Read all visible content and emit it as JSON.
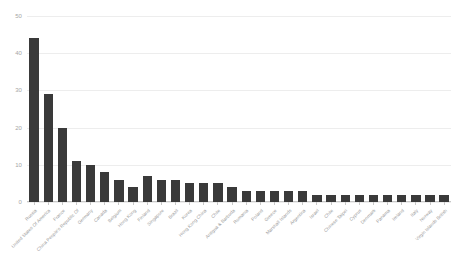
{
  "chart_data": {
    "type": "bar",
    "title": "",
    "subtitle": "",
    "xlabel": "",
    "ylabel": "",
    "ylim": [
      0,
      50
    ],
    "yticks": [
      0,
      10,
      20,
      30,
      40,
      50
    ],
    "grid": true,
    "legend": false,
    "bar_color": "#3a3a3a",
    "gridline_color": "#ededed",
    "tick_label_color": "#a6a6a6",
    "category_label_color": "#9a9a9a",
    "label_rotation_deg": -45,
    "categories": [
      "Russia",
      "United States Of America",
      "France",
      "China People's Republic Of",
      "Germany",
      "Canada",
      "Belgium",
      "Hong Kong",
      "Finland",
      "Singapore",
      "Brazil",
      "Korea",
      "Hong Kong China",
      "Chile",
      "Antigua & Barbuda",
      "Romania",
      "Poland",
      "Greece",
      "Marshall Islands",
      "Argentina",
      "Israel",
      "Chile",
      "Chinese Taipei",
      "Cyprus",
      "Denmark",
      "Panama",
      "Ireland",
      "Italy",
      "Norway",
      "Virgin Islands British"
    ],
    "values": [
      44,
      29,
      20,
      11,
      10,
      8,
      6,
      4,
      7,
      6,
      6,
      5,
      5,
      5,
      4,
      3,
      3,
      3,
      3,
      3,
      2,
      2,
      2,
      2,
      2,
      2,
      2,
      2,
      2,
      2
    ]
  }
}
